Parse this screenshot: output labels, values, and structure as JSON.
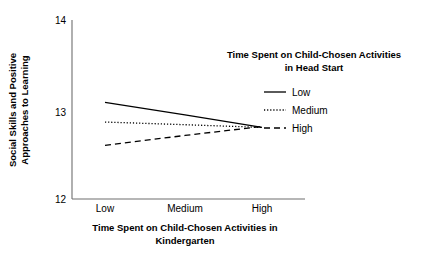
{
  "chart_data": {
    "type": "line",
    "title": "",
    "xlabel": "Time Spent on Child-Chosen Activities in Kindergarten",
    "ylabel": "Social Skills and Positive Approaches to Learning",
    "ylabel_line1": "Social Skills and Positive",
    "ylabel_line2": "Approaches to Learning",
    "xlabel_line1": "Time Spent on Child-Chosen Activities in",
    "xlabel_line2": "Kindergarten",
    "categories": [
      "Low",
      "Medium",
      "High"
    ],
    "x_tick_labels": [
      "Low",
      "Medium",
      "High"
    ],
    "y_tick_labels": [
      "14",
      "13",
      "12"
    ],
    "y_ticks": [
      14,
      13,
      12
    ],
    "ylim": [
      12,
      14
    ],
    "xlim": [
      0,
      2
    ],
    "grid": false,
    "legend_position": "upper right",
    "legend_title_line1": "Time Spent on Child-Chosen Activities",
    "legend_title_line2": "in Head Start",
    "legend_title": "Time Spent on Child-Chosen Activities in Head Start",
    "series": [
      {
        "name": "Low",
        "style": "solid",
        "values": [
          13.08,
          12.94,
          12.8
        ]
      },
      {
        "name": "Medium",
        "style": "dotted",
        "values": [
          12.86,
          12.83,
          12.8
        ]
      },
      {
        "name": "High",
        "style": "dashed",
        "values": [
          12.6,
          12.71,
          12.81
        ]
      }
    ],
    "line_color": "#000000"
  },
  "legend": {
    "entries": [
      {
        "label": "Low",
        "style": "solid"
      },
      {
        "label": "Medium",
        "style": "dotted"
      },
      {
        "label": "High",
        "style": "dashed"
      }
    ]
  }
}
